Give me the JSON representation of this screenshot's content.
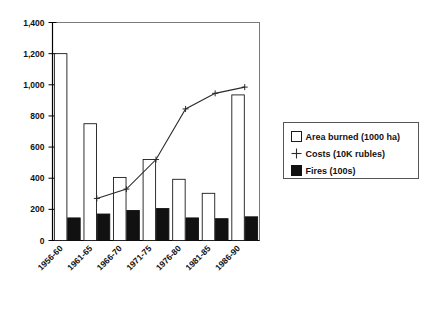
{
  "chart_data": {
    "type": "bar",
    "title": "",
    "subtitle": "",
    "xlabel": "",
    "ylabel": "",
    "categories": [
      "1956-60",
      "1961-65",
      "1966-70",
      "1971-75",
      "1976-80",
      "1981-85",
      "1986-90"
    ],
    "ylim": [
      0,
      1400
    ],
    "ytick_labels": [
      "0",
      "200",
      "400",
      "600",
      "800",
      "1,000",
      "1,200",
      "1,400"
    ],
    "ytick_values": [
      0,
      200,
      400,
      600,
      800,
      1000,
      1200,
      1400
    ],
    "grid": false,
    "legend_position": "right-outside",
    "series": [
      {
        "name": "Area burned (1000 ha)",
        "type": "bar",
        "style": "white-fill-black-outline",
        "values": [
          1200,
          750,
          405,
          520,
          393,
          303,
          935
        ]
      },
      {
        "name": "Fires (100s)",
        "type": "bar",
        "style": "black-fill",
        "values": [
          145,
          170,
          193,
          205,
          145,
          140,
          152
        ]
      },
      {
        "name": "Costs (10K rubles)",
        "type": "line",
        "style": "line-with-plus-markers",
        "values": [
          null,
          270,
          330,
          520,
          845,
          945,
          985
        ]
      }
    ]
  },
  "legend": {
    "entries": [
      {
        "label": "Area burned (1000 ha)",
        "marker": "white-square-icon"
      },
      {
        "label": "Costs (10K rubles)",
        "marker": "plus-marker-icon"
      },
      {
        "label": "Fires (100s)",
        "marker": "black-square-icon"
      }
    ]
  },
  "colors": {
    "axis": "#000000",
    "bar_outline": "#1a1a1a",
    "bar_white_fill": "#ffffff",
    "bar_black_fill": "#111111",
    "line": "#2b2b2b",
    "legend_border": "#555555",
    "background": "#ffffff"
  }
}
